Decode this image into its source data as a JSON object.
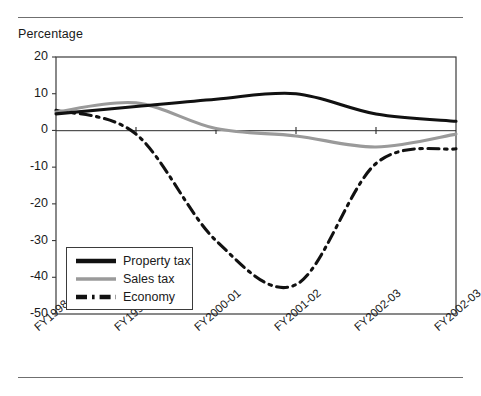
{
  "chart_data": {
    "type": "line",
    "title": "",
    "ylabel": "Percentage",
    "xlabel": "",
    "ylim": [
      -50,
      20
    ],
    "yticks": [
      20,
      10,
      0,
      -10,
      -20,
      -30,
      -40,
      -50
    ],
    "ytick_labels": [
      "20",
      "10",
      "0",
      "-10",
      "-20",
      "-30",
      "-40",
      "-50"
    ],
    "categories": [
      "FY1998-99",
      "FY1999-00",
      "FY2000-01",
      "FY2001-02",
      "FY2002-03",
      "FY2002-03"
    ],
    "grid": false,
    "legend_position": "lower-left-inside",
    "series": [
      {
        "name": "Property tax",
        "color": "#111111",
        "style": "solid",
        "values": [
          4.5,
          6.5,
          8.5,
          10.0,
          4.5,
          2.5
        ]
      },
      {
        "name": "Sales tax",
        "color": "#9a9a9a",
        "style": "solid",
        "values": [
          5.0,
          7.5,
          0.5,
          -1.5,
          -4.5,
          -1.0
        ]
      },
      {
        "name": "Economy",
        "color": "#111111",
        "style": "dash-dot",
        "values": [
          5.5,
          -1.0,
          -30.0,
          -42.0,
          -9.0,
          -5.0
        ]
      }
    ]
  },
  "legend": {
    "items": [
      {
        "label": "Property tax"
      },
      {
        "label": "Sales tax"
      },
      {
        "label": "Economy"
      }
    ]
  },
  "colors": {
    "property_tax": "#111111",
    "sales_tax": "#9a9a9a",
    "economy": "#111111",
    "axis": "#3b3b3b",
    "rule": "#6f6f6f"
  }
}
